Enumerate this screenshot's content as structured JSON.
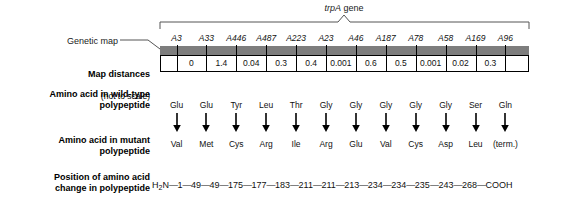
{
  "figure": {
    "gene_label_italic": "trpA",
    "gene_label_rest": " gene",
    "genetic_map_label": "Genetic map",
    "map_distance_label": "Map distances",
    "map_distance_sublabel": "(not to scale)",
    "wild_type_label": "Amino acid in wild-type\npolypeptide",
    "mutant_label": "Amino acid in mutant\npolypeptide",
    "position_label": "Position of amino acid\nchange in polypeptide",
    "colors": {
      "map_bar": "#7d7d7d",
      "line": "#000000",
      "text": "#111111"
    }
  },
  "chart_data": {
    "type": "diagram",
    "columns": [
      {
        "allele": "A3",
        "distance": "",
        "wild_type": "Glu",
        "mutant": "Val",
        "position": "49"
      },
      {
        "allele": "A33",
        "distance": "0",
        "wild_type": "Glu",
        "mutant": "Met",
        "position": "49"
      },
      {
        "allele": "A446",
        "distance": "1.4",
        "wild_type": "Tyr",
        "mutant": "Cys",
        "position": "175"
      },
      {
        "allele": "A487",
        "distance": "0.04",
        "wild_type": "Leu",
        "mutant": "Arg",
        "position": "177"
      },
      {
        "allele": "A223",
        "distance": "0.3",
        "wild_type": "Thr",
        "mutant": "Ile",
        "position": "183"
      },
      {
        "allele": "A23",
        "distance": "0.4",
        "wild_type": "Gly",
        "mutant": "Arg",
        "position": "211"
      },
      {
        "allele": "A46",
        "distance": "0.001",
        "wild_type": "Gly",
        "mutant": "Glu",
        "position": "211"
      },
      {
        "allele": "A187",
        "distance": "0.6",
        "wild_type": "Gly",
        "mutant": "Val",
        "position": "213"
      },
      {
        "allele": "A78",
        "distance": "0.5",
        "wild_type": "Gly",
        "mutant": "Cys",
        "position": "234"
      },
      {
        "allele": "A58",
        "distance": "0.001",
        "wild_type": "Gly",
        "mutant": "Asp",
        "position": "234"
      },
      {
        "allele": "A169",
        "distance": "0.02",
        "wild_type": "Ser",
        "mutant": "Leu",
        "position": "235"
      },
      {
        "allele": "A96",
        "distance": "0.3",
        "wild_type": "Gln",
        "mutant": "(term.)",
        "position": "243"
      }
    ],
    "chain_prefix": "H",
    "chain_prefix_sub": "2",
    "chain_prefix_rest": "N",
    "chain_head": "1",
    "chain_extra_positions": [
      "268"
    ],
    "chain_terminus": "COOH",
    "chain_full": "H2N—1—49—49—175—177—183—211—211—213—234—234—235—243—268—COOH"
  }
}
